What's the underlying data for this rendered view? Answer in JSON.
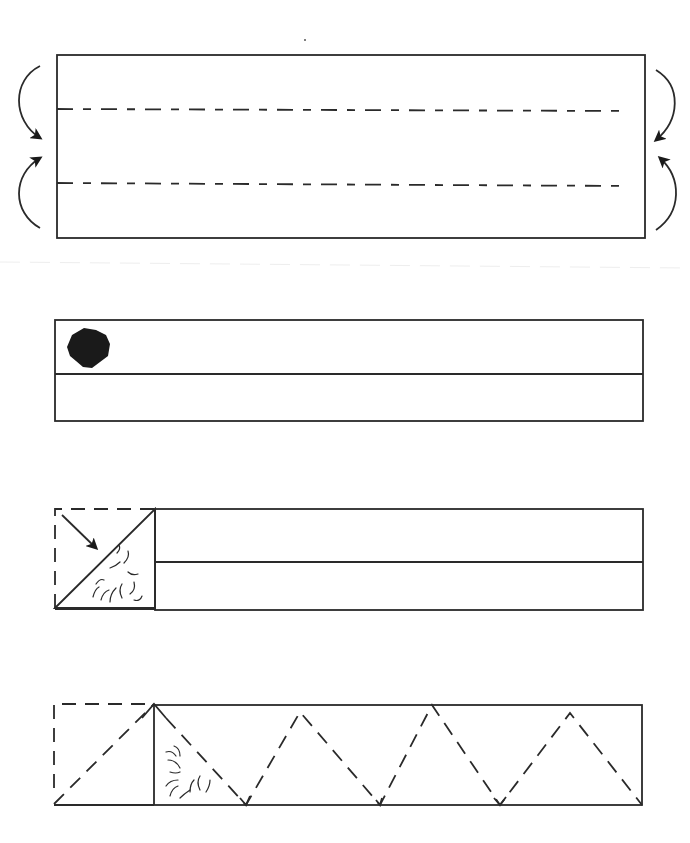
{
  "diagram": {
    "type": "folding-instructions",
    "steps": [
      {
        "id": 1,
        "description": "Strip with two dashed fold lines; top and bottom edges folded inward toward center (curved arrows on both sides)"
      },
      {
        "id": 2,
        "description": "Folded strip with center horizontal line; dark blot mark at upper-left corner"
      },
      {
        "id": 3,
        "description": "Left corner folded diagonally down (arrow), dashed outline of original square, squiggle texture on folded triangle"
      },
      {
        "id": 4,
        "description": "Triangular zig-zag dashed folding pattern along the strip, first triangle folded over with squiggle texture"
      }
    ],
    "colors": {
      "line": "#2a2a2a",
      "fill_mark": "#1a1a1a",
      "background": "#ffffff"
    }
  }
}
